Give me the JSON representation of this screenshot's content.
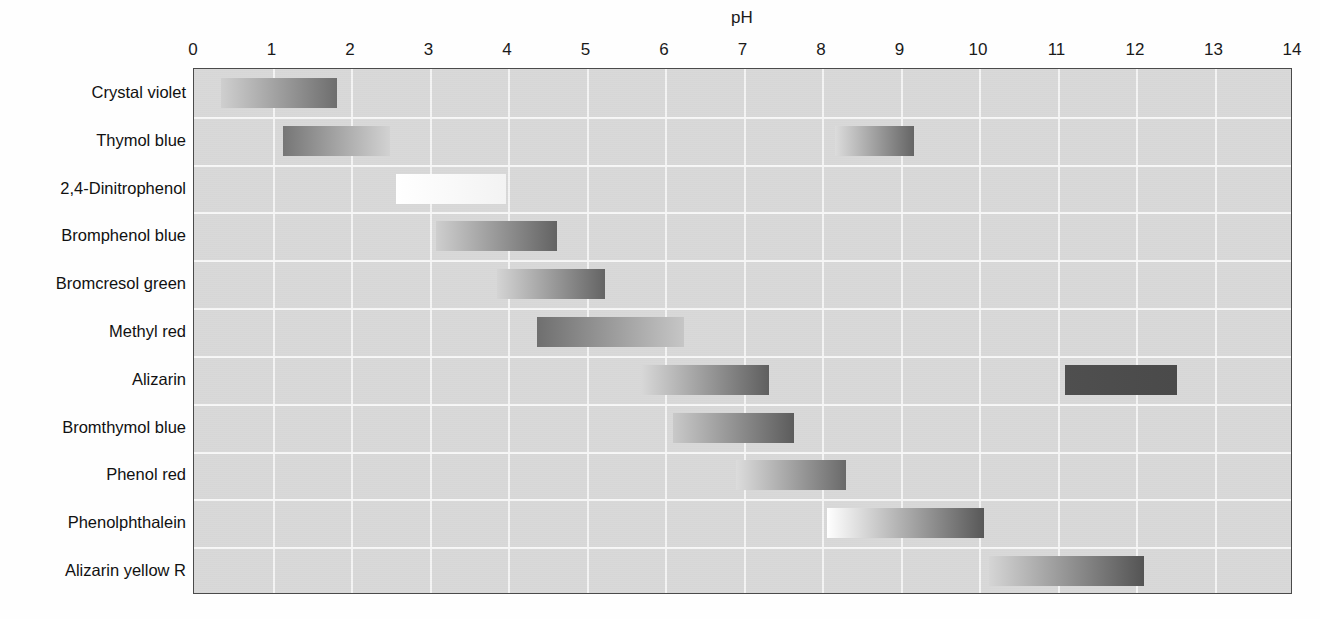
{
  "chart_data": {
    "type": "bar",
    "title": "pH",
    "xlabel": "pH",
    "ylabel": "",
    "xlim": [
      0,
      14
    ],
    "grid": true,
    "legend": "none",
    "orientation": "horizontal",
    "xticks": [
      "0",
      "1",
      "2",
      "3",
      "4",
      "5",
      "6",
      "7",
      "8",
      "9",
      "10",
      "11",
      "12",
      "13",
      "14"
    ],
    "xtick_values": [
      0,
      1,
      2,
      3,
      4,
      5,
      6,
      7,
      8,
      9,
      10,
      11,
      12,
      13,
      14
    ],
    "categories": [
      "Crystal violet",
      "Thymol blue",
      "2,4-Dinitrophenol",
      "Bromphenol blue",
      "Bromcresol green",
      "Methyl red",
      "Alizarin",
      "Bromthymol blue",
      "Phenol red",
      "Phenolphthalein",
      "Alizarin yellow R"
    ],
    "indicators": [
      {
        "name": "Crystal violet",
        "ranges": [
          {
            "start": 0.35,
            "end": 1.82,
            "from_color": "#cfcfcf",
            "to_color": "#6e6e6e"
          }
        ]
      },
      {
        "name": "Thymol blue",
        "ranges": [
          {
            "start": 1.13,
            "end": 2.5,
            "from_color": "#767676",
            "to_color": "#d2d2d2"
          },
          {
            "start": 8.17,
            "end": 9.17,
            "from_color": "#dcdcdc",
            "to_color": "#656565"
          }
        ]
      },
      {
        "name": "2,4-Dinitrophenol",
        "ranges": [
          {
            "start": 2.57,
            "end": 3.97,
            "from_color": "#ffffff",
            "to_color": "#f3f3f3"
          }
        ]
      },
      {
        "name": "Bromphenol blue",
        "ranges": [
          {
            "start": 3.08,
            "end": 4.63,
            "from_color": "#cecece",
            "to_color": "#636363"
          }
        ]
      },
      {
        "name": "Bromcresol green",
        "ranges": [
          {
            "start": 3.86,
            "end": 5.24,
            "from_color": "#d4d4d4",
            "to_color": "#646464"
          }
        ]
      },
      {
        "name": "Methyl red",
        "ranges": [
          {
            "start": 4.37,
            "end": 6.24,
            "from_color": "#6f6f6f",
            "to_color": "#c6c6c6"
          }
        ]
      },
      {
        "name": "Alizarin",
        "ranges": [
          {
            "start": 5.69,
            "end": 7.32,
            "from_color": "#d8d8d8",
            "to_color": "#5f5f5f"
          },
          {
            "start": 11.09,
            "end": 12.52,
            "from_color": "#4f4f4f",
            "to_color": "#4a4a4a"
          }
        ]
      },
      {
        "name": "Bromthymol blue",
        "ranges": [
          {
            "start": 6.1,
            "end": 7.64,
            "from_color": "#c9c9c9",
            "to_color": "#5c5c5c"
          }
        ]
      },
      {
        "name": "Phenol red",
        "ranges": [
          {
            "start": 6.9,
            "end": 8.3,
            "from_color": "#dcdcdc",
            "to_color": "#6a6a6a"
          }
        ]
      },
      {
        "name": "Phenolphthalein",
        "ranges": [
          {
            "start": 8.07,
            "end": 10.07,
            "from_color": "#ffffff",
            "to_color": "#585858"
          }
        ]
      },
      {
        "name": "Alizarin yellow R",
        "ranges": [
          {
            "start": 10.13,
            "end": 12.1,
            "from_color": "#d5d5d5",
            "to_color": "#545454"
          }
        ]
      }
    ]
  },
  "style": {
    "plot_background": "#d9d9d9",
    "grid_color": "#f5f5f5",
    "axis_color": "#4a4a4a",
    "text_color": "#111111",
    "page_background": "#ffffff"
  }
}
